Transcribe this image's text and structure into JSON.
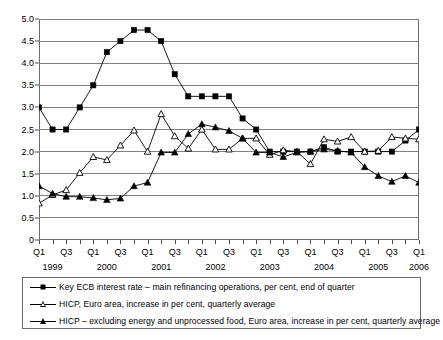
{
  "chart_data": {
    "type": "line",
    "title": "",
    "xlabel": "",
    "ylabel": "",
    "ylim": [
      0,
      5.0
    ],
    "ytick_step": 0.5,
    "grid": true,
    "legend_position": "bottom",
    "ytick_labels": [
      "5.0",
      "4.5",
      "4.0",
      "3.5",
      "3.0",
      "2.5",
      "2.0",
      "1.5",
      "1.0",
      "0.5",
      "0"
    ],
    "ytick_values": [
      5.0,
      4.5,
      4.0,
      3.5,
      3.0,
      2.5,
      2.0,
      1.5,
      1.0,
      0.5,
      0
    ],
    "x": [
      "1999Q1",
      "1999Q2",
      "1999Q3",
      "1999Q4",
      "2000Q1",
      "2000Q2",
      "2000Q3",
      "2000Q4",
      "2001Q1",
      "2001Q2",
      "2001Q3",
      "2001Q4",
      "2002Q1",
      "2002Q2",
      "2002Q3",
      "2002Q4",
      "2003Q1",
      "2003Q2",
      "2003Q3",
      "2003Q4",
      "2004Q1",
      "2004Q2",
      "2004Q3",
      "2004Q4",
      "2005Q1",
      "2005Q2",
      "2005Q3",
      "2005Q4",
      "2006Q1"
    ],
    "xtick_labels": [
      "Q1",
      "",
      "Q3",
      "",
      "Q1",
      "",
      "Q3",
      "",
      "Q1",
      "",
      "Q3",
      "",
      "Q1",
      "",
      "Q3",
      "",
      "Q1",
      "",
      "Q3",
      "",
      "Q1",
      "",
      "Q3",
      "",
      "Q1",
      "",
      "Q3",
      "",
      "Q1"
    ],
    "year_labels": [
      {
        "label": "1999",
        "index": 1
      },
      {
        "label": "2000",
        "index": 5
      },
      {
        "label": "2001",
        "index": 9
      },
      {
        "label": "2002",
        "index": 13
      },
      {
        "label": "2003",
        "index": 17
      },
      {
        "label": "2004",
        "index": 21
      },
      {
        "label": "2005",
        "index": 25
      },
      {
        "label": "2006",
        "index": 28
      }
    ],
    "series": [
      {
        "name": "Key ECB interest rate – main refinancing operations, per cent, end of quarter",
        "marker": "square-filled",
        "values": [
          3.0,
          2.5,
          2.5,
          3.0,
          3.5,
          4.25,
          4.5,
          4.75,
          4.75,
          4.5,
          3.75,
          3.25,
          3.25,
          3.25,
          3.25,
          2.75,
          2.5,
          2.0,
          2.0,
          2.0,
          2.0,
          2.1,
          2.0,
          2.0,
          2.0,
          2.0,
          2.0,
          2.25,
          2.5
        ]
      },
      {
        "name": "HICP,  Euro area, increase in per cent, quarterly average",
        "marker": "triangle-hollow",
        "values": [
          0.83,
          1.02,
          1.13,
          1.52,
          1.88,
          1.81,
          2.14,
          2.48,
          2.0,
          2.85,
          2.35,
          2.07,
          2.5,
          2.05,
          2.05,
          2.3,
          2.3,
          1.93,
          2.03,
          2.0,
          1.72,
          2.28,
          2.23,
          2.33,
          2.0,
          2.02,
          2.33,
          2.3,
          2.28
        ]
      },
      {
        "name": "HICP – excluding energy and unprocessed food, Euro area, increase in per cent, quarterly average",
        "marker": "triangle-filled",
        "values": [
          1.22,
          1.05,
          0.98,
          0.98,
          0.95,
          0.91,
          0.94,
          1.22,
          1.3,
          1.98,
          1.98,
          2.4,
          2.62,
          2.55,
          2.47,
          2.3,
          1.98,
          1.98,
          1.88,
          1.98,
          2.0,
          2.05,
          2.02,
          1.98,
          1.65,
          1.45,
          1.32,
          1.45,
          1.3
        ]
      }
    ]
  },
  "legend": {
    "items": [
      {
        "label": "Key ECB interest rate – main refinancing operations, per cent, end of quarter",
        "marker": "square-filled"
      },
      {
        "label": "HICP,  Euro area, increase in per cent, quarterly average",
        "marker": "triangle-hollow"
      },
      {
        "label": "HICP – excluding energy and unprocessed food, Euro area, increase in per cent, quarterly average",
        "marker": "triangle-filled"
      }
    ]
  },
  "colors": {
    "series_line": "#000000",
    "grid": "#808080",
    "frame": "#6b6b6b",
    "background": "#ffffff"
  }
}
